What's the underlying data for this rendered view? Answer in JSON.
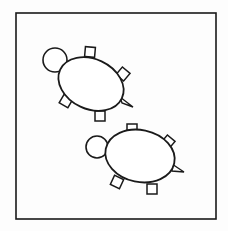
{
  "figure": {
    "stroke_color": "#1a1a1a",
    "background_color": "#ffffff",
    "frame": {
      "x": 16,
      "y": 13,
      "width": 200,
      "height": 206
    },
    "turtles": [
      {
        "id": "turtle-top",
        "head": {
          "cx": 55,
          "cy": 60,
          "r": 12
        },
        "shell": {
          "cx": 91,
          "cy": 84,
          "rx": 34,
          "ry": 25,
          "rotate": 25
        },
        "legs": [
          {
            "cx": 90,
            "cy": 52,
            "rotate": 5
          },
          {
            "cx": 123,
            "cy": 74,
            "rotate": 40
          },
          {
            "cx": 66,
            "cy": 101,
            "rotate": 30
          },
          {
            "cx": 100,
            "cy": 116,
            "rotate": 0
          }
        ],
        "tail": {
          "points": "120,97 133,107 122,103"
        }
      },
      {
        "id": "turtle-bottom",
        "head": {
          "cx": 97,
          "cy": 147,
          "r": 11
        },
        "shell": {
          "cx": 140,
          "cy": 156,
          "rx": 35,
          "ry": 26,
          "rotate": 12
        },
        "legs": [
          {
            "cx": 132,
            "cy": 129,
            "rotate": 0
          },
          {
            "cx": 168,
            "cy": 142,
            "rotate": 40
          },
          {
            "cx": 117,
            "cy": 182,
            "rotate": 25
          },
          {
            "cx": 152,
            "cy": 189,
            "rotate": 0
          }
        ],
        "tail": {
          "points": "172,164 184,172 172,171"
        }
      }
    ]
  }
}
